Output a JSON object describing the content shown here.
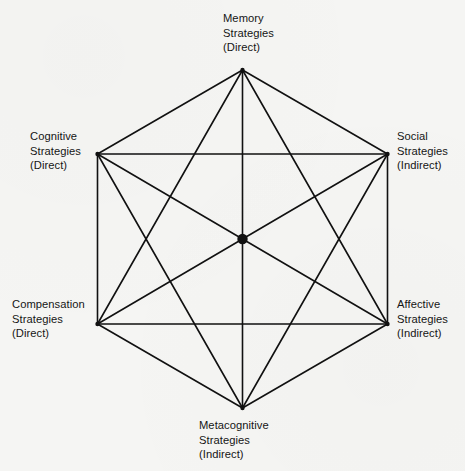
{
  "diagram": {
    "shape": "hexagon",
    "graph_type": "complete-graph-k6",
    "stroke_color": "#111111",
    "background_color": "#f5f5f3",
    "center_dot": {
      "name": "center-node",
      "cx": 242.5,
      "cy": 239,
      "r": 5.2,
      "fill": "#111111"
    },
    "vertices": [
      {
        "id": "memory",
        "cx": 242.5,
        "cy": 70,
        "label_lines": [
          "Memory",
          "Strategies",
          "(Direct)"
        ],
        "line1": "Memory",
        "line2": "Strategies",
        "line3": "(Direct)",
        "category": "Direct"
      },
      {
        "id": "social",
        "cx": 387.5,
        "cy": 154,
        "label_lines": [
          "Social",
          "Strategies",
          "(Indirect)"
        ],
        "line1": "Social",
        "line2": "Strategies",
        "line3": "(Indirect)",
        "category": "Indirect"
      },
      {
        "id": "affective",
        "cx": 387.5,
        "cy": 324,
        "label_lines": [
          "Affective",
          "Strategies",
          "(Indirect)"
        ],
        "line1": "Affective",
        "line2": "Strategies",
        "line3": "(Indirect)",
        "category": "Indirect"
      },
      {
        "id": "metacognitive",
        "cx": 242.5,
        "cy": 408,
        "label_lines": [
          "Metacognitive",
          "Strategies",
          "(Indirect)"
        ],
        "line1": "Metacognitive",
        "line2": "Strategies",
        "line3": "(Indirect)",
        "category": "Indirect"
      },
      {
        "id": "compensation",
        "cx": 97.5,
        "cy": 324,
        "label_lines": [
          "Compensation",
          "Strategies",
          "(Direct)"
        ],
        "line1": "Compensation",
        "line2": "Strategies",
        "line3": "(Direct)",
        "category": "Direct"
      },
      {
        "id": "cognitive",
        "cx": 97.5,
        "cy": 154,
        "label_lines": [
          "Cognitive",
          "Strategies",
          "(Direct)"
        ],
        "line1": "Cognitive",
        "line2": "Strategies",
        "line3": "(Direct)",
        "category": "Direct"
      }
    ],
    "edges": [
      [
        "memory",
        "social"
      ],
      [
        "social",
        "affective"
      ],
      [
        "affective",
        "metacognitive"
      ],
      [
        "metacognitive",
        "compensation"
      ],
      [
        "compensation",
        "cognitive"
      ],
      [
        "cognitive",
        "memory"
      ],
      [
        "memory",
        "affective"
      ],
      [
        "memory",
        "metacognitive"
      ],
      [
        "memory",
        "compensation"
      ],
      [
        "social",
        "metacognitive"
      ],
      [
        "social",
        "compensation"
      ],
      [
        "social",
        "cognitive"
      ],
      [
        "affective",
        "compensation"
      ],
      [
        "affective",
        "cognitive"
      ],
      [
        "metacognitive",
        "cognitive"
      ]
    ]
  }
}
